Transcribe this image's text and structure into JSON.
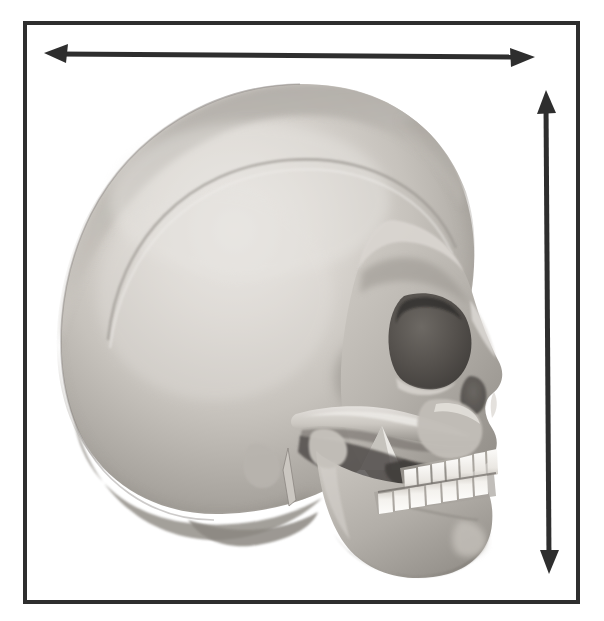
{
  "figure": {
    "title": "Human skull, lateral (side) view with dimension arrows",
    "domain_type": "anatomical-illustration",
    "width_px": 604,
    "height_px": 621,
    "background_color": "#ffffff"
  },
  "frame": {
    "name": "border-frame",
    "stroke_color": "#2e2e2e",
    "stroke_width_px": 4,
    "x": 25,
    "y": 23,
    "width": 553,
    "height": 579,
    "fill": "none"
  },
  "arrows": [
    {
      "id": "horizontal-dimension-arrow",
      "orientation": "horizontal",
      "heads": "double",
      "color": "#2e2e2e",
      "shaft_thickness_px": 5,
      "x1": 46,
      "y1": 53,
      "x2": 533,
      "y2": 57,
      "measures": "skull length (anterior-posterior)"
    },
    {
      "id": "vertical-dimension-arrow",
      "orientation": "vertical",
      "heads": "double",
      "color": "#2e2e2e",
      "shaft_thickness_px": 5,
      "x1": 546,
      "y1": 92,
      "x2": 549,
      "y2": 573,
      "measures": "skull height (superior-inferior)"
    }
  ],
  "skull": {
    "name": "human-skull-lateral",
    "view": "left lateral, facing right",
    "bounds": {
      "x": 55,
      "y": 84,
      "width": 452,
      "height": 487
    },
    "palette": {
      "bone_highlight": "#e6e4e0",
      "bone_light": "#d2cfca",
      "bone_mid": "#b3afa9",
      "bone_shadow": "#8e8a84",
      "bone_deep_shadow": "#6b6762",
      "cavity_dark": "#4a4642",
      "cavity_darkest": "#3a3734",
      "tooth_white": "#f7f6f3",
      "tooth_shadow": "#cfccc6",
      "suture_line": "#a39f99",
      "outline": "#76726d"
    },
    "parts": [
      {
        "name": "cranial-vault",
        "label": "Cranial vault / calvaria"
      },
      {
        "name": "frontal-bone",
        "label": "Frontal bone"
      },
      {
        "name": "parietal-bone",
        "label": "Parietal bone"
      },
      {
        "name": "occipital-bone",
        "label": "Occipital bone"
      },
      {
        "name": "temporal-line",
        "label": "Superior temporal line"
      },
      {
        "name": "temporal-fossa",
        "label": "Temporal fossa"
      },
      {
        "name": "orbit",
        "label": "Orbit (eye socket)"
      },
      {
        "name": "nasal-aperture",
        "label": "Nasal aperture"
      },
      {
        "name": "zygomatic-arch",
        "label": "Zygomatic arch"
      },
      {
        "name": "zygomatic-bone",
        "label": "Zygomatic bone"
      },
      {
        "name": "maxilla",
        "label": "Maxilla"
      },
      {
        "name": "mandible",
        "label": "Mandible"
      },
      {
        "name": "coronoid-process",
        "label": "Coronoid process"
      },
      {
        "name": "condylar-process",
        "label": "Condylar process"
      },
      {
        "name": "mastoid-process",
        "label": "Mastoid process"
      },
      {
        "name": "styloid-process",
        "label": "Styloid process"
      },
      {
        "name": "upper-teeth",
        "label": "Maxillary teeth"
      },
      {
        "name": "lower-teeth",
        "label": "Mandibular teeth"
      },
      {
        "name": "mental-protuberance",
        "label": "Mental protuberance (chin)"
      }
    ],
    "upper_teeth_count": 7,
    "lower_teeth_count": 7
  }
}
